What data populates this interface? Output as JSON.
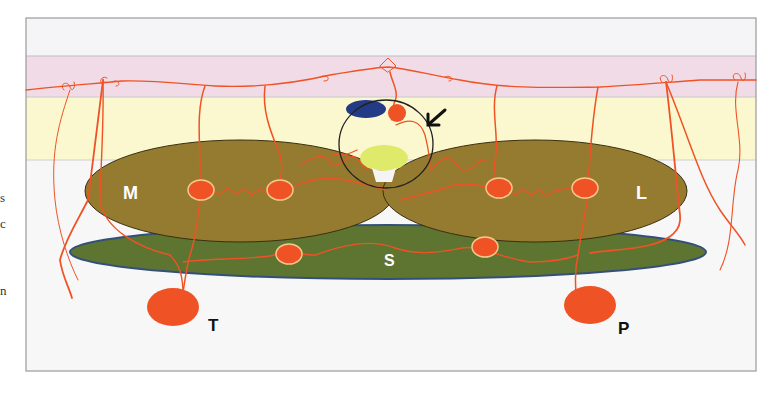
{
  "edge_fragments": [
    "s",
    "c",
    "n"
  ],
  "colors": {
    "frame_bg": "#f4f4f4",
    "band_top": "#f5f5f7",
    "band_pink": "#f1dbe6",
    "band_yellow": "#fbf8cf",
    "lower_bg": "#f7f7f7",
    "nucleus_M_L": "#957b2f",
    "nucleus_S": "#5d7531",
    "S_outline": "#34507a",
    "vessel": "#ef5325",
    "node_outline": "#f6c98a",
    "blue_body": "#233a86",
    "lime_body": "#dfe96a",
    "circle_outline": "#222222",
    "arrow": "#111111"
  },
  "diagram": {
    "labels": {
      "M": "M",
      "L": "L",
      "S": "S",
      "T": "T",
      "P": "P"
    },
    "layers": [
      "top band",
      "pink band",
      "yellow band",
      "lower region"
    ],
    "structures": [
      {
        "id": "M",
        "shape": "ellipse",
        "color": "olive"
      },
      {
        "id": "L",
        "shape": "ellipse",
        "color": "olive"
      },
      {
        "id": "S",
        "shape": "elongated ellipse",
        "color": "green"
      },
      {
        "id": "T",
        "shape": "large red node"
      },
      {
        "id": "P",
        "shape": "large red node"
      }
    ],
    "callout": {
      "type": "circle",
      "contains": [
        "blue oval",
        "red node",
        "lime oval"
      ],
      "arrow": "pointing down-left"
    }
  }
}
